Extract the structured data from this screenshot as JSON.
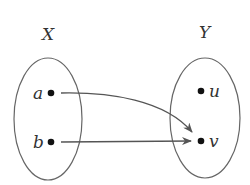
{
  "diagram": {
    "type": "function-mapping",
    "sets": [
      {
        "name": "X",
        "elements": [
          "a",
          "b"
        ]
      },
      {
        "name": "Y",
        "elements": [
          "u",
          "v"
        ]
      }
    ],
    "mappings": [
      {
        "from": "a",
        "to": "v"
      },
      {
        "from": "b",
        "to": "v"
      }
    ],
    "labels": {
      "set_x": "X",
      "set_y": "Y",
      "a": "a",
      "b": "b",
      "u": "u",
      "v": "v"
    },
    "colors": {
      "stroke": "#555555",
      "dot": "#111111",
      "text": "#333333"
    }
  }
}
